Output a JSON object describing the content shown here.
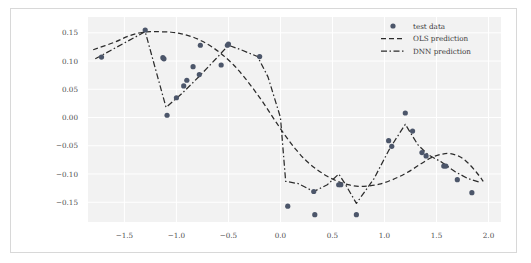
{
  "figure": {
    "background": "#ffffff",
    "panel_background": "#f2f2f2",
    "grid_color": "#ffffff",
    "border_color": "#d8d8d8"
  },
  "chart_data": {
    "type": "scatter",
    "title": "",
    "xlabel": "",
    "ylabel": "",
    "xlim": [
      -1.85,
      2.12
    ],
    "ylim": [
      -0.185,
      0.178
    ],
    "xticks": [
      -1.5,
      -1.0,
      -0.5,
      0.0,
      0.5,
      1.0,
      1.5,
      2.0
    ],
    "xtick_labels": [
      "−1.5",
      "−1.0",
      "−0.5",
      "0.0",
      "0.5",
      "1.0",
      "1.5",
      "2.0"
    ],
    "yticks": [
      0.15,
      0.1,
      0.05,
      0.0,
      -0.05,
      -0.1,
      -0.15
    ],
    "ytick_labels": [
      "0.15",
      "0.10",
      "0.05",
      "0.00",
      "−0.05",
      "−0.10",
      "−0.15"
    ],
    "grid": true,
    "legend_position": "upper right",
    "marker_color": "#4c566a",
    "line_color": "#2b2b2b",
    "series": [
      {
        "name": "test data",
        "kind": "scatter",
        "marker": "circle",
        "color": "#4c566a",
        "points": [
          [
            -1.72,
            0.107
          ],
          [
            -1.3,
            0.155
          ],
          [
            -1.13,
            0.106
          ],
          [
            -1.12,
            0.104
          ],
          [
            -1.09,
            0.004
          ],
          [
            -1.0,
            0.035
          ],
          [
            -0.93,
            0.056
          ],
          [
            -0.9,
            0.066
          ],
          [
            -0.84,
            0.09
          ],
          [
            -0.78,
            0.076
          ],
          [
            -0.77,
            0.128
          ],
          [
            -0.57,
            0.093
          ],
          [
            -0.51,
            0.128
          ],
          [
            -0.5,
            0.13
          ],
          [
            -0.2,
            0.108
          ],
          [
            0.07,
            -0.157
          ],
          [
            0.32,
            -0.131
          ],
          [
            0.33,
            -0.172
          ],
          [
            0.56,
            -0.119
          ],
          [
            0.58,
            -0.119
          ],
          [
            0.73,
            -0.172
          ],
          [
            1.04,
            -0.041
          ],
          [
            1.07,
            -0.051
          ],
          [
            1.2,
            0.008
          ],
          [
            1.27,
            -0.024
          ],
          [
            1.36,
            -0.062
          ],
          [
            1.4,
            -0.068
          ],
          [
            1.57,
            -0.086
          ],
          [
            1.59,
            -0.086
          ],
          [
            1.7,
            -0.11
          ],
          [
            1.84,
            -0.133
          ]
        ]
      },
      {
        "name": "OLS prediction",
        "kind": "line",
        "linestyle": "dashed",
        "color": "#2b2b2b",
        "points": [
          [
            -1.8,
            0.12
          ],
          [
            -1.6,
            0.133
          ],
          [
            -1.45,
            0.145
          ],
          [
            -1.32,
            0.151
          ],
          [
            -1.2,
            0.152
          ],
          [
            -1.05,
            0.151
          ],
          [
            -0.95,
            0.148
          ],
          [
            -0.85,
            0.143
          ],
          [
            -0.75,
            0.135
          ],
          [
            -0.65,
            0.124
          ],
          [
            -0.55,
            0.11
          ],
          [
            -0.45,
            0.093
          ],
          [
            -0.35,
            0.072
          ],
          [
            -0.25,
            0.048
          ],
          [
            -0.15,
            0.022
          ],
          [
            -0.05,
            -0.006
          ],
          [
            0.05,
            -0.033
          ],
          [
            0.15,
            -0.057
          ],
          [
            0.25,
            -0.077
          ],
          [
            0.35,
            -0.092
          ],
          [
            0.45,
            -0.104
          ],
          [
            0.55,
            -0.113
          ],
          [
            0.65,
            -0.119
          ],
          [
            0.75,
            -0.122
          ],
          [
            0.85,
            -0.121
          ],
          [
            0.95,
            -0.118
          ],
          [
            1.05,
            -0.112
          ],
          [
            1.15,
            -0.104
          ],
          [
            1.25,
            -0.094
          ],
          [
            1.35,
            -0.082
          ],
          [
            1.45,
            -0.071
          ],
          [
            1.55,
            -0.065
          ],
          [
            1.63,
            -0.064
          ],
          [
            1.72,
            -0.069
          ],
          [
            1.8,
            -0.08
          ],
          [
            1.88,
            -0.096
          ],
          [
            1.95,
            -0.113
          ]
        ]
      },
      {
        "name": "DNN prediction",
        "kind": "line",
        "linestyle": "dashdot",
        "color": "#2b2b2b",
        "points": [
          [
            -1.78,
            0.104
          ],
          [
            -1.3,
            0.152
          ],
          [
            -1.1,
            0.018
          ],
          [
            -0.95,
            0.042
          ],
          [
            -0.78,
            0.073
          ],
          [
            -0.62,
            0.104
          ],
          [
            -0.5,
            0.128
          ],
          [
            -0.38,
            0.12
          ],
          [
            -0.22,
            0.108
          ],
          [
            -0.12,
            0.072
          ],
          [
            0.0,
            0.0
          ],
          [
            0.05,
            -0.113
          ],
          [
            0.17,
            -0.117
          ],
          [
            0.32,
            -0.131
          ],
          [
            0.45,
            -0.119
          ],
          [
            0.56,
            -0.1
          ],
          [
            0.62,
            -0.117
          ],
          [
            0.73,
            -0.152
          ],
          [
            0.9,
            -0.108
          ],
          [
            1.05,
            -0.055
          ],
          [
            1.2,
            -0.012
          ],
          [
            1.32,
            -0.048
          ],
          [
            1.42,
            -0.066
          ],
          [
            1.55,
            -0.079
          ],
          [
            1.68,
            -0.096
          ],
          [
            1.8,
            -0.108
          ],
          [
            1.92,
            -0.115
          ]
        ]
      }
    ]
  },
  "legend": {
    "items": [
      {
        "label": "test data",
        "style": "marker"
      },
      {
        "label": "OLS prediction",
        "style": "dashed"
      },
      {
        "label": "DNN prediction",
        "style": "dashdot"
      }
    ]
  }
}
